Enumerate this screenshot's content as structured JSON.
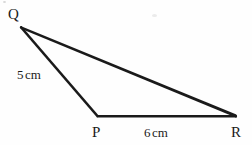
{
  "figure": {
    "type": "triangle-geometry-diagram",
    "background_color": "#fefefe",
    "stroke_color": "#1a1a1a",
    "stroke_width": 2,
    "canvas": {
      "width": 252,
      "height": 145
    },
    "vertices": [
      {
        "name": "Q",
        "label": "Q",
        "x": 21,
        "y": 27,
        "label_x": 8,
        "label_y": 7
      },
      {
        "name": "P",
        "label": "P",
        "x": 97,
        "y": 116,
        "label_x": 92,
        "label_y": 125
      },
      {
        "name": "R",
        "label": "R",
        "x": 236,
        "y": 116,
        "label_x": 231,
        "label_y": 125
      }
    ],
    "sides": [
      {
        "name": "QP",
        "from": "Q",
        "to": "P",
        "measure_value": "5",
        "measure_unit": "cm",
        "label": "5 cm"
      },
      {
        "name": "PR",
        "from": "P",
        "to": "R",
        "measure_value": "6",
        "measure_unit": "cm",
        "label": "6 cm"
      },
      {
        "name": "QR",
        "from": "Q",
        "to": "R",
        "measure_value": "",
        "measure_unit": "",
        "label": ""
      }
    ],
    "labels": {
      "vertex_q": "Q",
      "vertex_p": "P",
      "vertex_r": "R",
      "side_pq_number": "5",
      "side_pq_unit": "cm",
      "side_pr_number": "6",
      "side_pr_unit": "cm"
    }
  }
}
